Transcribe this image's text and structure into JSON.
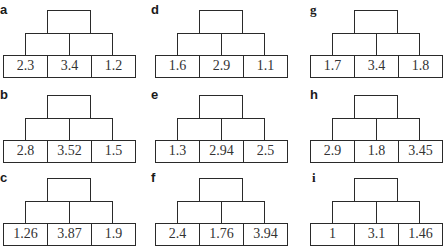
{
  "pyramids": [
    {
      "label": "a",
      "bottom": [
        "2.3",
        "3.4",
        "1.2"
      ]
    },
    {
      "label": "b",
      "bottom": [
        "2.8",
        "3.52",
        "1.5"
      ]
    },
    {
      "label": "c",
      "bottom": [
        "1.26",
        "3.87",
        "1.9"
      ]
    },
    {
      "label": "d",
      "bottom": [
        "1.6",
        "2.9",
        "1.1"
      ]
    },
    {
      "label": "e",
      "bottom": [
        "1.3",
        "2.94",
        "2.5"
      ]
    },
    {
      "label": "f",
      "bottom": [
        "2.4",
        "1.76",
        "3.94"
      ]
    },
    {
      "label": "g",
      "bottom": [
        "1.7",
        "3.4",
        "1.8"
      ]
    },
    {
      "label": "h",
      "bottom": [
        "2.9",
        "1.8",
        "3.45"
      ]
    },
    {
      "label": "i",
      "bottom": [
        "1",
        "3.1",
        "1.46"
      ]
    }
  ]
}
